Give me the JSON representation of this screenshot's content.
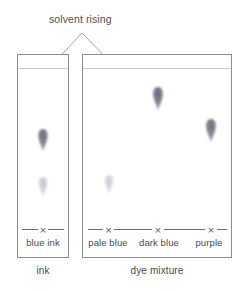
{
  "figure": {
    "callout": {
      "label": "solvent rising",
      "apex_x": 82,
      "apex_y": 33
    },
    "plates": [
      {
        "name": "ink",
        "caption": "ink",
        "x": 17,
        "y": 54,
        "width": 52,
        "height": 204,
        "solvent_front_y": 68,
        "baseline_y": 229,
        "lanes": [
          {
            "name": "blue ink",
            "label": "blue ink",
            "origin_mark": "X",
            "origin_x": 43,
            "spots": [
              {
                "name": "dark-blue-spot",
                "color": "#7d7f8c",
                "x": 43,
                "y": 138,
                "width": 9,
                "height": 20,
                "opacity": 0.92
              },
              {
                "name": "pale-blue-spot",
                "color": "#bfc4cc",
                "x": 43,
                "y": 185,
                "width": 8,
                "height": 18,
                "opacity": 0.7
              }
            ]
          }
        ]
      },
      {
        "name": "dye mixture",
        "caption": "dye mixture",
        "x": 82,
        "y": 54,
        "width": 150,
        "height": 204,
        "solvent_front_y": 68,
        "baseline_y": 229,
        "lanes": [
          {
            "name": "pale blue",
            "label": "pale blue",
            "origin_mark": "X",
            "origin_x": 108,
            "spots": [
              {
                "name": "pale-blue-spot",
                "color": "#c9ced4",
                "x": 109,
                "y": 183,
                "width": 8,
                "height": 18,
                "opacity": 0.62
              }
            ]
          },
          {
            "name": "dark blue",
            "label": "dark blue",
            "origin_mark": "X",
            "origin_x": 158,
            "spots": [
              {
                "name": "dark-blue-spot",
                "color": "#75777f",
                "x": 158,
                "y": 96,
                "width": 9,
                "height": 21,
                "opacity": 0.95
              }
            ]
          },
          {
            "name": "purple",
            "label": "purple",
            "origin_mark": "X",
            "origin_x": 211,
            "spots": [
              {
                "name": "purple-spot",
                "color": "#7a7783",
                "x": 211,
                "y": 128,
                "width": 9,
                "height": 21,
                "opacity": 0.93
              }
            ]
          }
        ]
      }
    ],
    "colors": {
      "plate_border": "#8d8d8d",
      "solvent_line": "#c8c8c8",
      "baseline": "#6f6f6f",
      "callout_line": "#9a9a9a",
      "text": "#4a4a4a",
      "background": "#ffffff"
    }
  }
}
